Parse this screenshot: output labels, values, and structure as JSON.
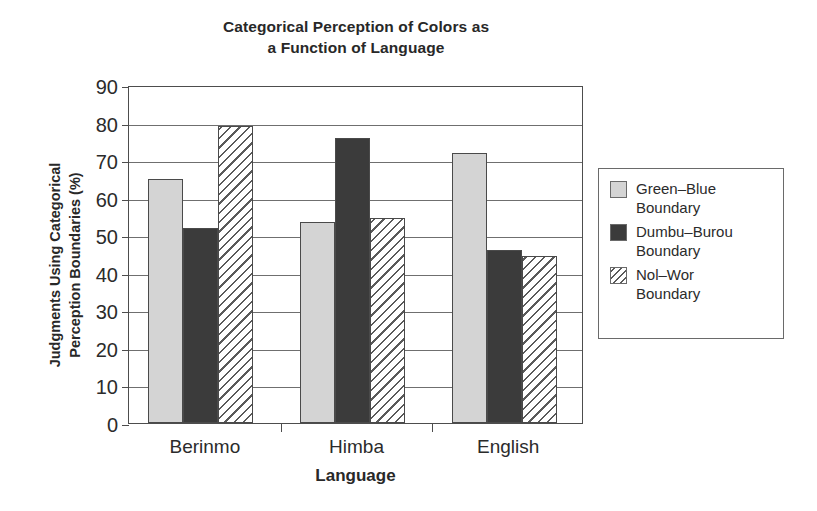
{
  "chart_data": {
    "type": "bar",
    "title": "Categorical Perception of Colors as a Function of Language",
    "title_lines": [
      "Categorical Perception of Colors as",
      "a Function of Language"
    ],
    "xlabel": "Language",
    "ylabel": "Judgments Using Categorical Perception Boundaries (%)",
    "ylabel_lines": [
      "Judgments Using Categorical",
      "Perception Boundaries (%)"
    ],
    "categories": [
      "Berinmo",
      "Himba",
      "English"
    ],
    "series": [
      {
        "name": "Green–Blue Boundary",
        "name_lines": [
          "Green–Blue",
          "Boundary"
        ],
        "values": [
          65,
          53.5,
          72
        ],
        "fill": "solid-light-gray",
        "color": "#d4d4d4"
      },
      {
        "name": "Dumbu–Burou Boundary",
        "name_lines": [
          "Dumbu–Burou",
          "Boundary"
        ],
        "values": [
          52,
          76,
          46
        ],
        "fill": "solid-dark-gray",
        "color": "#3b3b3b"
      },
      {
        "name": "Nol–Wor Boundary",
        "name_lines": [
          "Nol–Wor",
          "Boundary"
        ],
        "values": [
          79,
          54.5,
          44.5
        ],
        "fill": "diagonal-hatch",
        "color": "#ffffff"
      }
    ],
    "ylim": [
      0,
      90
    ],
    "yticks": [
      0,
      10,
      20,
      30,
      40,
      50,
      60,
      70,
      80,
      90
    ],
    "ytick_labels": [
      "0",
      "10",
      "20",
      "30",
      "40",
      "50",
      "60",
      "70",
      "80",
      "90"
    ],
    "grid": "horizontal",
    "legend_position": "right-outside",
    "legend_border": "#6a6a6a",
    "axis_color": "#4d4d4d",
    "background": "#ffffff"
  }
}
